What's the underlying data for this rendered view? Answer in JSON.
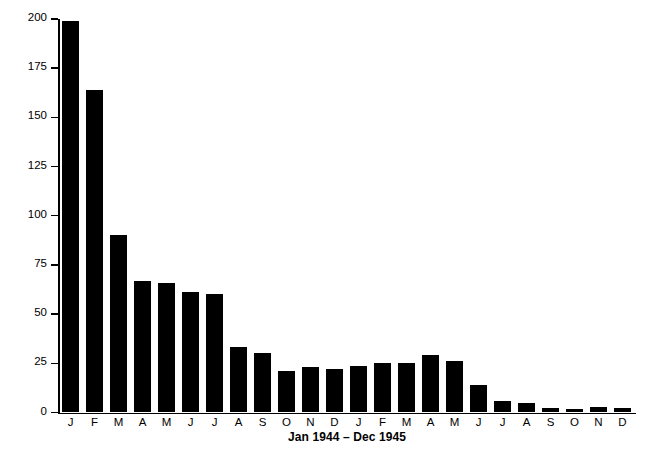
{
  "chart_data": {
    "type": "bar",
    "title": "",
    "xlabel": "Jan 1944 – Dec 1945",
    "ylabel": "# cases/annum/1,000 aver strength",
    "categories": [
      "J",
      "F",
      "M",
      "A",
      "M",
      "J",
      "J",
      "A",
      "S",
      "O",
      "N",
      "D",
      "J",
      "F",
      "M",
      "A",
      "M",
      "J",
      "J",
      "A",
      "S",
      "O",
      "N",
      "D"
    ],
    "values": [
      199,
      164,
      90,
      67,
      66,
      61,
      60,
      33,
      30,
      21,
      23,
      22,
      23.5,
      25,
      25,
      29,
      26,
      14,
      6,
      5,
      2,
      1.5,
      3,
      2
    ],
    "ylim": [
      0,
      200
    ],
    "yticks": [
      0,
      25,
      50,
      75,
      100,
      125,
      150,
      175,
      200
    ],
    "ytick_labels": [
      "0",
      "25",
      "50",
      "75",
      "100",
      "125",
      "150",
      "175",
      "200"
    ],
    "grid": false,
    "legend": "none",
    "bar_color": "#000000",
    "background_color": "#ffffff"
  }
}
